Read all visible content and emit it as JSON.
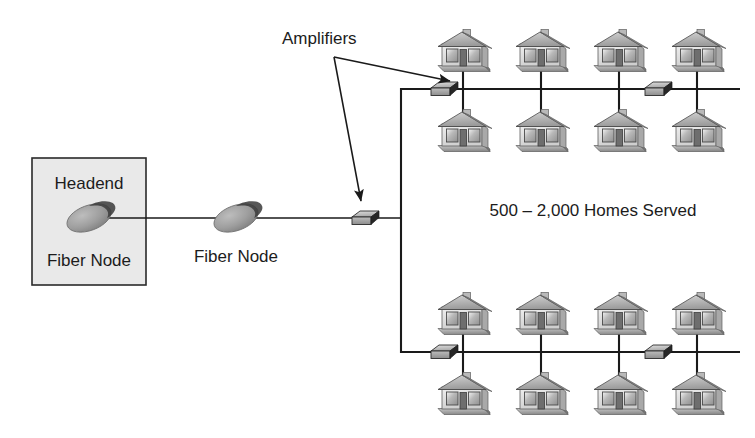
{
  "diagram": {
    "colors": {
      "line": "#1a1a1a",
      "text": "#1c1c1c",
      "background": "#ffffff",
      "headend_fill": "#e8e8e8",
      "node_fill": "#9a9a9a",
      "node_shadow": "#1d1d1d",
      "amp_top": "#c9c9c9",
      "amp_side": "#2a2a2a",
      "house_body": "#e2e2e2",
      "house_roof": "#b4b4b4",
      "house_window": "#9d9d9d",
      "house_door": "#6b6b6b"
    },
    "labels": {
      "amplifiers": "Amplifiers",
      "headend": "Headend",
      "fiber_node_inner": "Fiber Node",
      "fiber_node_outer": "Fiber Node",
      "homes_served": "500 – 2,000 Homes Served"
    },
    "headend_box": {
      "label_top": "Headend",
      "label_bottom": "Fiber Node",
      "x": 32,
      "y": 158,
      "width": 114,
      "height": 127
    },
    "fiber_nodes": [
      {
        "name": "headend-fiber-node",
        "cx": 89,
        "cy": 218
      },
      {
        "name": "trunk-fiber-node",
        "cx": 236,
        "cy": 218
      }
    ],
    "amplifiers": [
      {
        "name": "trunk-amplifier",
        "cx": 366,
        "cy": 218
      },
      {
        "name": "top-bus-amplifier-1",
        "cx": 463,
        "cy": 89
      },
      {
        "name": "top-bus-amplifier-2",
        "cx": 663,
        "cy": 89
      },
      {
        "name": "bottom-bus-amplifier-1",
        "cx": 463,
        "cy": 352
      },
      {
        "name": "bottom-bus-amplifier-2",
        "cx": 663,
        "cy": 352
      }
    ],
    "buses": [
      {
        "name": "top-distribution-bus",
        "y": 89,
        "x1": 401,
        "x2": 740
      },
      {
        "name": "bottom-distribution-bus",
        "y": 352,
        "x1": 401,
        "x2": 740
      }
    ],
    "riser": {
      "name": "vertical-riser",
      "x": 401,
      "y1": 89,
      "y2": 352
    },
    "trunk_line": {
      "name": "fiber-trunk-line",
      "y": 218,
      "x1": 89,
      "x2": 401
    },
    "house_rows": [
      {
        "name": "top-cluster-upper-row",
        "y": 32,
        "houses_x": [
          440,
          518,
          596,
          674
        ]
      },
      {
        "name": "top-cluster-lower-row",
        "y": 112,
        "houses_x": [
          440,
          518,
          596,
          674
        ]
      },
      {
        "name": "bottom-cluster-upper-row",
        "y": 295,
        "houses_x": [
          440,
          518,
          596,
          674
        ]
      },
      {
        "name": "bottom-cluster-lower-row",
        "y": 375,
        "houses_x": [
          440,
          518,
          596,
          674
        ]
      }
    ],
    "drop_lines_x": [
      463,
      541,
      619,
      697
    ],
    "annotation_arrows": [
      {
        "name": "amplifiers-arrow-to-top-bus",
        "from_x": 334,
        "from_y": 57,
        "to_x": 452,
        "to_y": 82
      },
      {
        "name": "amplifiers-arrow-to-trunk",
        "from_x": 334,
        "from_y": 57,
        "to_x": 362,
        "to_y": 203
      }
    ]
  }
}
